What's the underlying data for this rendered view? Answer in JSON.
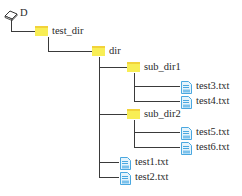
{
  "tree": {
    "root": {
      "label": "D",
      "icon": "drive-icon"
    },
    "test_dir": {
      "label": "test_dir",
      "icon": "folder-icon"
    },
    "dir": {
      "label": "dir",
      "icon": "folder-icon"
    },
    "sub_dir1": {
      "label": "sub_dir1",
      "icon": "folder-icon",
      "files": [
        {
          "label": "test3.txt",
          "icon": "text-file-icon"
        },
        {
          "label": "test4.txt",
          "icon": "text-file-icon"
        }
      ]
    },
    "sub_dir2": {
      "label": "sub_dir2",
      "icon": "folder-icon",
      "files": [
        {
          "label": "test5.txt",
          "icon": "text-file-icon"
        },
        {
          "label": "test6.txt",
          "icon": "text-file-icon"
        }
      ]
    },
    "dir_files": [
      {
        "label": "test1.txt",
        "icon": "text-file-icon"
      },
      {
        "label": "test2.txt",
        "icon": "text-file-icon"
      }
    ]
  },
  "colors": {
    "folder": "#f8ee55",
    "file": "#4aa8e0",
    "line": "#3a3a3a"
  }
}
